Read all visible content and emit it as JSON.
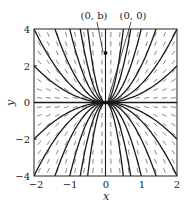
{
  "chart_data": {
    "type": "line",
    "subtype": "direction-field-with-solution-curves",
    "title": "",
    "xlabel": "x",
    "ylabel": "y",
    "xlim": [
      -2,
      2
    ],
    "ylim": [
      -4,
      4
    ],
    "xticks": [
      -2,
      -1,
      0,
      1,
      2
    ],
    "yticks": [
      -4,
      -2,
      0,
      2,
      4
    ],
    "xtick_labels": [
      "−2",
      "−1",
      "0",
      "1",
      "2"
    ],
    "ytick_labels": [
      "−4",
      "−2",
      "0",
      "2",
      "4"
    ],
    "grid": false,
    "legend": null,
    "slope_field": {
      "description": "short dashed segments with slope 2y/x",
      "x_samples": [
        -1.85,
        -1.6,
        -1.35,
        -1.1,
        -0.85,
        -0.6,
        -0.35,
        -0.1,
        0.15,
        0.4,
        0.65,
        0.9,
        1.15,
        1.4,
        1.65,
        1.9
      ],
      "y_samples": [
        -3.7,
        -3.2,
        -2.7,
        -2.2,
        -1.7,
        -1.2,
        -0.7,
        -0.25,
        0.25,
        0.7,
        1.2,
        1.7,
        2.2,
        2.7,
        3.2,
        3.7
      ]
    },
    "series": [
      {
        "name": "y = C x^2",
        "C_values": [
          -16,
          -8,
          -4,
          -2,
          -1,
          -0.5,
          0.5,
          1,
          2,
          4,
          8,
          16
        ]
      },
      {
        "name": "x = 0 (vertical solution)",
        "x": 0
      }
    ],
    "annotations": [
      {
        "text": "(0, b)",
        "points_to": [
          0,
          2.7
        ],
        "marker": "dot"
      },
      {
        "text": "(0, 0)",
        "points_to": [
          0,
          0
        ],
        "marker": "dot"
      }
    ]
  },
  "labels": {
    "x_axis": "x",
    "y_axis": "y",
    "annot_0b": "(0, b)",
    "annot_00": "(0, 0)",
    "xticks": [
      "−2",
      "−1",
      "0",
      "1",
      "2"
    ],
    "yticks": [
      "4",
      "2",
      "0",
      "−2",
      "−4"
    ]
  },
  "colors": {
    "curve": "#1a1a1a",
    "dash": "#555555",
    "frame": "#222222"
  }
}
